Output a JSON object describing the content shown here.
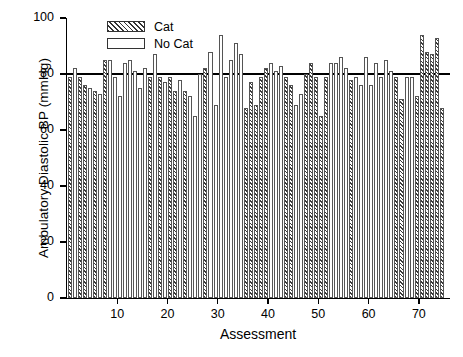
{
  "chart_data": {
    "type": "bar",
    "title": "",
    "xlabel": "Assessment",
    "ylabel": "Ambulatory Diastolic BP (mmHg)",
    "ylim": [
      0,
      100
    ],
    "xlim": [
      0,
      76
    ],
    "ytick_labels": [
      "0",
      "20",
      "40",
      "60",
      "80",
      "100"
    ],
    "ytick_values": [
      0,
      20,
      40,
      60,
      80,
      100
    ],
    "xtick_labels": [
      "10",
      "20",
      "30",
      "40",
      "50",
      "60",
      "70"
    ],
    "xtick_values": [
      10,
      20,
      30,
      40,
      50,
      60,
      70
    ],
    "grid": false,
    "legend_position": "top-center",
    "legend": [
      {
        "name": "Cat",
        "pattern": "diagonal-hatch"
      },
      {
        "name": "No Cat",
        "pattern": "open"
      }
    ],
    "annotations": [
      {
        "type": "hline",
        "value": 80,
        "label": ""
      }
    ],
    "categories": [
      1,
      2,
      3,
      4,
      5,
      6,
      7,
      8,
      9,
      10,
      11,
      12,
      13,
      14,
      15,
      16,
      17,
      18,
      19,
      20,
      21,
      22,
      23,
      24,
      25,
      26,
      27,
      28,
      29,
      30,
      31,
      32,
      33,
      34,
      35,
      36,
      37,
      38,
      39,
      40,
      41,
      42,
      43,
      44,
      45,
      46,
      47,
      48,
      49,
      50,
      51,
      52,
      53,
      54,
      55,
      56,
      57,
      58,
      59,
      60,
      61,
      62,
      63,
      64,
      65,
      66,
      67,
      68,
      69,
      70,
      71,
      72,
      73,
      74,
      75
    ],
    "values": [
      79,
      82,
      79,
      76,
      75,
      74,
      73,
      85,
      85,
      79,
      72,
      84,
      85,
      81,
      75,
      82,
      79,
      87,
      79,
      77,
      79,
      74,
      78,
      74,
      72,
      65,
      80,
      82,
      88,
      69,
      94,
      79,
      85,
      91,
      87,
      68,
      77,
      69,
      79,
      82,
      84,
      81,
      83,
      79,
      76,
      69,
      73,
      80,
      84,
      79,
      65,
      79,
      84,
      84,
      86,
      82,
      78,
      79,
      76,
      86,
      76,
      84,
      79,
      85,
      81,
      79,
      71,
      79,
      79,
      72,
      94,
      88,
      87,
      93,
      68
    ],
    "series_flags": [
      "cat",
      "nocat",
      "cat",
      "cat",
      "nocat",
      "cat",
      "nocat",
      "cat",
      "nocat",
      "nocat",
      "nocat",
      "nocat",
      "nocat",
      "nocat",
      "nocat",
      "nocat",
      "cat",
      "nocat",
      "cat",
      "nocat",
      "cat",
      "cat",
      "nocat",
      "cat",
      "nocat",
      "nocat",
      "nocat",
      "cat",
      "nocat",
      "nocat",
      "nocat",
      "nocat",
      "nocat",
      "nocat",
      "nocat",
      "cat",
      "cat",
      "cat",
      "cat",
      "cat",
      "nocat",
      "nocat",
      "nocat",
      "cat",
      "cat",
      "nocat",
      "nocat",
      "cat",
      "cat",
      "cat",
      "cat",
      "cat",
      "nocat",
      "nocat",
      "nocat",
      "nocat",
      "cat",
      "nocat",
      "nocat",
      "nocat",
      "nocat",
      "nocat",
      "nocat",
      "nocat",
      "nocat",
      "cat",
      "cat",
      "nocat",
      "nocat",
      "cat",
      "cat",
      "cat",
      "cat",
      "cat",
      "cat"
    ]
  }
}
